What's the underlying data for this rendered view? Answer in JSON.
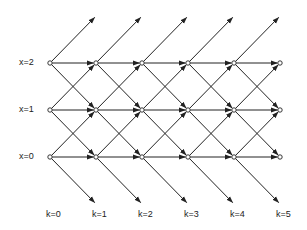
{
  "diagram": {
    "type": "lattice",
    "columns_x": [
      50,
      96,
      142,
      188,
      234,
      280
    ],
    "rows_y": [
      157,
      110,
      63
    ],
    "up_tip_y": 16,
    "down_tip_y": 204,
    "row_labels": [
      "x=0",
      "x=1",
      "x=2"
    ],
    "col_labels": [
      "k=0",
      "k=1",
      "k=2",
      "k=3",
      "k=4",
      "k=5"
    ],
    "line_color": "#222222"
  }
}
